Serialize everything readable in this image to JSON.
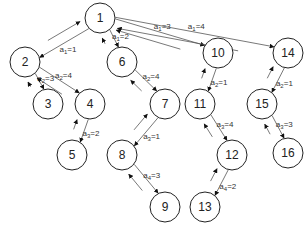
{
  "diagram": {
    "type": "tree",
    "nodes": [
      {
        "id": "1",
        "label": "1",
        "x": 100,
        "y": 18
      },
      {
        "id": "2",
        "label": "2",
        "x": 25,
        "y": 62
      },
      {
        "id": "3",
        "label": "3",
        "x": 48,
        "y": 104
      },
      {
        "id": "4",
        "label": "4",
        "x": 90,
        "y": 104
      },
      {
        "id": "5",
        "label": "5",
        "x": 72,
        "y": 155
      },
      {
        "id": "6",
        "label": "6",
        "x": 122,
        "y": 62
      },
      {
        "id": "7",
        "label": "7",
        "x": 165,
        "y": 104
      },
      {
        "id": "8",
        "label": "8",
        "x": 122,
        "y": 155
      },
      {
        "id": "9",
        "label": "9",
        "x": 165,
        "y": 207
      },
      {
        "id": "10",
        "label": "10",
        "x": 218,
        "y": 53
      },
      {
        "id": "11",
        "label": "11",
        "x": 200,
        "y": 104
      },
      {
        "id": "12",
        "label": "12",
        "x": 232,
        "y": 155
      },
      {
        "id": "13",
        "label": "13",
        "x": 205,
        "y": 207
      },
      {
        "id": "14",
        "label": "14",
        "x": 288,
        "y": 53
      },
      {
        "id": "15",
        "label": "15",
        "x": 262,
        "y": 104
      },
      {
        "id": "16",
        "label": "16",
        "x": 288,
        "y": 153
      }
    ],
    "edges": [
      {
        "from": "1",
        "to": "2",
        "label": "a",
        "sub": "1",
        "value": "1"
      },
      {
        "from": "2",
        "to": "3",
        "label": "a",
        "sub": "2",
        "value": "3"
      },
      {
        "from": "2",
        "to": "4",
        "label": "a",
        "sub": "2",
        "value": "4"
      },
      {
        "from": "4",
        "to": "5",
        "label": "a",
        "sub": "3",
        "value": "2"
      },
      {
        "from": "1",
        "to": "6",
        "label": "a",
        "sub": "1",
        "value": "2"
      },
      {
        "from": "6",
        "to": "7",
        "label": "a",
        "sub": "2",
        "value": "4"
      },
      {
        "from": "7",
        "to": "8",
        "label": "a",
        "sub": "3",
        "value": "1"
      },
      {
        "from": "8",
        "to": "9",
        "label": "a",
        "sub": "4",
        "value": "3"
      },
      {
        "from": "1",
        "to": "10",
        "label": "a",
        "sub": "1",
        "value": "3"
      },
      {
        "from": "10",
        "to": "11",
        "label": "a",
        "sub": "2",
        "value": "1"
      },
      {
        "from": "11",
        "to": "12",
        "label": "a",
        "sub": "3",
        "value": "4"
      },
      {
        "from": "12",
        "to": "13",
        "label": "a",
        "sub": "4",
        "value": "2"
      },
      {
        "from": "1",
        "to": "14",
        "label": "a",
        "sub": "1",
        "value": "4"
      },
      {
        "from": "14",
        "to": "15",
        "label": "a",
        "sub": "2",
        "value": "1"
      },
      {
        "from": "15",
        "to": "16",
        "label": "a",
        "sub": "3",
        "value": "3"
      }
    ]
  }
}
